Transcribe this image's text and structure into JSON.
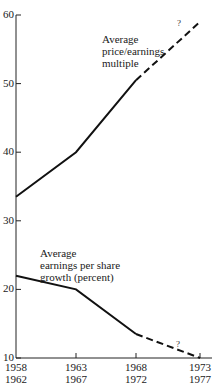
{
  "chart_data": {
    "type": "line",
    "title": "",
    "xlabel": "",
    "ylabel": "",
    "ylim": [
      10,
      60
    ],
    "yticks": [
      10,
      20,
      30,
      40,
      50,
      60
    ],
    "categories": [
      "1958-1962",
      "1963-1967",
      "1968-1972",
      "1973-1977"
    ],
    "x_tick_labels": [
      {
        "top": "1958",
        "bottom": "1962"
      },
      {
        "top": "1963",
        "bottom": "1967"
      },
      {
        "top": "1968",
        "bottom": "1972"
      },
      {
        "top": "1973",
        "bottom": "1977"
      }
    ],
    "series": [
      {
        "name": "Average price/earnings multiple",
        "label_lines": [
          "Average",
          "price/earnings",
          "multiple"
        ],
        "values": [
          33.5,
          40,
          50.5,
          59
        ],
        "dashed_from_index": 2,
        "projection_note": "?"
      },
      {
        "name": "Average earnings per share growth (percent)",
        "label_lines": [
          "Average",
          "earnings per share",
          "growth (percent)"
        ],
        "values": [
          22,
          20,
          13.5,
          10
        ],
        "dashed_from_index": 2,
        "projection_note": "?"
      }
    ],
    "grid": false,
    "legend": "inline labels"
  }
}
